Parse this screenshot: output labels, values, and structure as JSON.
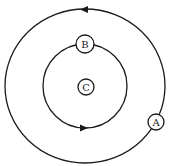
{
  "diagram": {
    "stroke_color": "#1a1a1a",
    "background": "#ffffff",
    "outer_orbit": {
      "direction": "counterclockwise",
      "arrow": "arrow-left-icon"
    },
    "inner_orbit": {
      "direction": "clockwise",
      "arrow": "arrow-right-icon"
    },
    "bodies": [
      {
        "id": "A",
        "label": "A",
        "position": "outer-orbit-right"
      },
      {
        "id": "B",
        "label": "B",
        "position": "inner-orbit-top"
      },
      {
        "id": "C",
        "label": "C",
        "position": "center"
      }
    ]
  }
}
